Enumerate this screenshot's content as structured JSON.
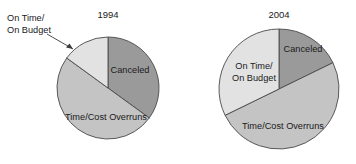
{
  "figure": {
    "background_color": "#ffffff",
    "text_color": "#1a1a1a",
    "width": 356,
    "height": 164
  },
  "chart_data": {
    "type": "pie",
    "title": "",
    "subtitle": "",
    "xlabel": "",
    "ylabel": "",
    "grid": false,
    "legend_position": "none",
    "labels_inline": true,
    "categories": [
      "Canceled",
      "Time/Cost Overruns",
      "On Time/On Budget"
    ],
    "colors": [
      "#9a9a9a",
      "#c4c4c4",
      "#e2e2e2"
    ],
    "charts": [
      {
        "title": "1994",
        "center": [
          108,
          88
        ],
        "radius": 51,
        "start_angle_deg": 0,
        "slices": [
          {
            "name": "Canceled",
            "value": 35,
            "unit": "%",
            "color": "#9a9a9a",
            "start_deg": 0,
            "end_deg": 126,
            "label": "Canceled",
            "label_placement": "inside",
            "label_pos": [
              130,
              70
            ]
          },
          {
            "name": "Time/Cost Overruns",
            "value": 50,
            "unit": "%",
            "color": "#c4c4c4",
            "start_deg": 126,
            "end_deg": 306,
            "label": "Time/Cost Overruns",
            "label_placement": "inside",
            "label_pos": [
              108,
              117
            ]
          },
          {
            "name": "On Time/On Budget",
            "value": 15,
            "unit": "%",
            "color": "#e2e2e2",
            "start_deg": 306,
            "end_deg": 360,
            "label": "On Time/\nOn Budget",
            "label_placement": "callout",
            "label_line1": "On Time/",
            "label_line2": "On Budget",
            "label_pos": [
              8,
              20
            ],
            "arrow_from": [
              48,
              34
            ],
            "arrow_to": [
              76,
              50
            ]
          }
        ]
      },
      {
        "title": "2004",
        "center": [
          279,
          89
        ],
        "radius": 60,
        "start_angle_deg": 0,
        "slices": [
          {
            "name": "Canceled",
            "value": 18,
            "unit": "%",
            "color": "#9a9a9a",
            "start_deg": 0,
            "end_deg": 64,
            "label": "Canceled",
            "label_placement": "inside",
            "label_pos": [
              301,
              49
            ]
          },
          {
            "name": "Time/Cost Overruns",
            "value": 50,
            "unit": "%",
            "color": "#c4c4c4",
            "start_deg": 64,
            "end_deg": 244,
            "label": "Time/Cost Overruns",
            "label_placement": "inside",
            "label_pos": [
              283,
              127
            ]
          },
          {
            "name": "On Time/On Budget",
            "value": 32,
            "unit": "%",
            "color": "#e2e2e2",
            "start_deg": 244,
            "end_deg": 360,
            "label": "On Time/\nOn Budget",
            "label_placement": "inside",
            "label_line1": "On Time/",
            "label_line2": "On Budget",
            "label_pos": [
              254,
              69
            ]
          }
        ]
      }
    ]
  },
  "charts_text": {
    "left": {
      "year": "1994",
      "canceled": "Canceled",
      "overruns": "Time/Cost Overruns",
      "ontime_line1": "On Time/",
      "ontime_line2": "On Budget"
    },
    "right": {
      "year": "2004",
      "canceled": "Canceled",
      "overruns": "Time/Cost Overruns",
      "ontime_line1": "On Time/",
      "ontime_line2": "On Budget"
    }
  }
}
